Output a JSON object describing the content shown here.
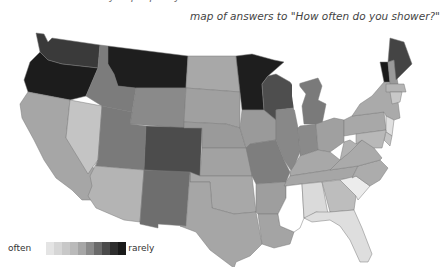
{
  "header": {
    "cut_text": "...data from the survey of people by ...",
    "title": "map of answers to \"How often do you shower?\""
  },
  "legend": {
    "low_label": "often",
    "high_label": "rarely",
    "ramp": [
      "#e4e4e4",
      "#d6d6d6",
      "#c8c8c8",
      "#bababa",
      "#a6a6a6",
      "#8a8a8a",
      "#6a6a6a",
      "#4a4a4a",
      "#2e2e2e",
      "#1a1a1a"
    ]
  },
  "map": {
    "type": "choropleth",
    "region": "contiguous United States",
    "scale": "grayscale, light = often, dark = rarely",
    "states": [
      {
        "id": "WA",
        "shade": "#3a3a3a"
      },
      {
        "id": "OR",
        "shade": "#1c1c1c"
      },
      {
        "id": "CA",
        "shade": "#a6a6a6"
      },
      {
        "id": "NV",
        "shade": "#c4c4c4"
      },
      {
        "id": "ID",
        "shade": "#7c7c7c"
      },
      {
        "id": "MT",
        "shade": "#1e1e1e"
      },
      {
        "id": "WY",
        "shade": "#8a8a8a"
      },
      {
        "id": "UT",
        "shade": "#7a7a7a"
      },
      {
        "id": "AZ",
        "shade": "#b4b4b4"
      },
      {
        "id": "CO",
        "shade": "#4c4c4c"
      },
      {
        "id": "NM",
        "shade": "#6e6e6e"
      },
      {
        "id": "ND",
        "shade": "#a8a8a8"
      },
      {
        "id": "SD",
        "shade": "#a0a0a0"
      },
      {
        "id": "NE",
        "shade": "#9a9a9a"
      },
      {
        "id": "KS",
        "shade": "#a2a2a2"
      },
      {
        "id": "OK",
        "shade": "#a8a8a8"
      },
      {
        "id": "TX",
        "shade": "#a6a6a6"
      },
      {
        "id": "MN",
        "shade": "#1e1e1e"
      },
      {
        "id": "IA",
        "shade": "#9a9a9a"
      },
      {
        "id": "MO",
        "shade": "#7e7e7e"
      },
      {
        "id": "AR",
        "shade": "#9e9e9e"
      },
      {
        "id": "LA",
        "shade": "#a4a4a4"
      },
      {
        "id": "WI",
        "shade": "#4e4e4e"
      },
      {
        "id": "IL",
        "shade": "#888888"
      },
      {
        "id": "MI",
        "shade": "#7a7a7a"
      },
      {
        "id": "IN",
        "shade": "#8a8a8a"
      },
      {
        "id": "OH",
        "shade": "#a0a0a0"
      },
      {
        "id": "KY",
        "shade": "#a8a8a8"
      },
      {
        "id": "TN",
        "shade": "#a6a6a6"
      },
      {
        "id": "MS",
        "shade": "#ffffff"
      },
      {
        "id": "AL",
        "shade": "#dadada"
      },
      {
        "id": "GA",
        "shade": "#bdbdbd"
      },
      {
        "id": "FL",
        "shade": "#dedede"
      },
      {
        "id": "SC",
        "shade": "#ececec"
      },
      {
        "id": "NC",
        "shade": "#acacac"
      },
      {
        "id": "VA",
        "shade": "#aaaaaa"
      },
      {
        "id": "WV",
        "shade": "#b2b2b2"
      },
      {
        "id": "PA",
        "shade": "#a8a8a8"
      },
      {
        "id": "NY",
        "shade": "#aaaaaa"
      },
      {
        "id": "VT",
        "shade": "#1a1a1a"
      },
      {
        "id": "NH",
        "shade": "#9a9a9a"
      },
      {
        "id": "ME",
        "shade": "#444444"
      },
      {
        "id": "MA",
        "shade": "#b4b4b4"
      },
      {
        "id": "CT",
        "shade": "#c8c8c8"
      },
      {
        "id": "NJ",
        "shade": "#e0e0e0"
      },
      {
        "id": "DE",
        "shade": "#c4c4c4"
      },
      {
        "id": "MD",
        "shade": "#b8b8b8"
      }
    ]
  }
}
